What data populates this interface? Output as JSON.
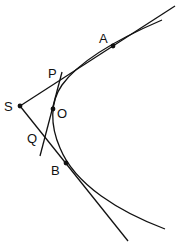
{
  "diagram": {
    "type": "parabola-tangents",
    "colors": {
      "stroke": "#111111",
      "background": "#ffffff"
    },
    "points": {
      "S": {
        "label": "S",
        "x": 20,
        "y": 106,
        "lx": 4,
        "ly": 111
      },
      "A": {
        "label": "A",
        "x": 113,
        "y": 46,
        "lx": 99,
        "ly": 43
      },
      "P": {
        "label": "P",
        "lx": 48,
        "ly": 78
      },
      "O": {
        "label": "O",
        "x": 53,
        "y": 109,
        "lx": 57,
        "ly": 118
      },
      "Q": {
        "label": "Q",
        "lx": 27,
        "ly": 143
      },
      "B": {
        "label": "B",
        "x": 66,
        "y": 163,
        "lx": 51,
        "ly": 175
      }
    },
    "lines": [
      {
        "name": "tangent-at-A",
        "from": "S",
        "through": "A"
      },
      {
        "name": "tangent-at-B",
        "from": "S",
        "through": "B"
      },
      {
        "name": "tangent-at-O",
        "from": "P",
        "to": "Q"
      }
    ],
    "curve": {
      "name": "parabola",
      "vertex": "O"
    }
  }
}
